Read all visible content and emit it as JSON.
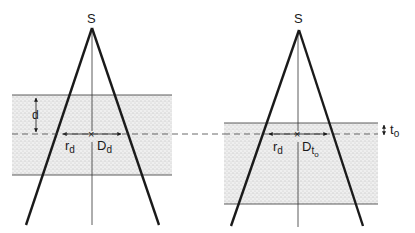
{
  "colors": {
    "ink": "#1a1a1a",
    "slab_fill": "#e4e4e4",
    "stipple": "#8a8a8a",
    "background": "#ffffff"
  },
  "left_panel": {
    "source_label": "S",
    "depth_label": "d",
    "radius_label": "r",
    "radius_sub": "d",
    "dose_label": "D",
    "dose_sub": "d",
    "center_marker": "×"
  },
  "right_panel": {
    "source_label": "S",
    "thickness_label": "t",
    "thickness_sub": "o",
    "radius_label": "r",
    "radius_sub": "d",
    "dose_label": "D",
    "dose_sub": "t",
    "dose_subsub": "o",
    "center_marker": "×"
  }
}
